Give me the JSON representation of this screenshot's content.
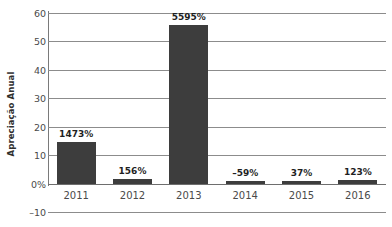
{
  "chart_data": {
    "type": "bar",
    "title": "",
    "xlabel": "",
    "ylabel": "Apreciação Anual",
    "categories": [
      "2011",
      "2012",
      "2013",
      "2014",
      "2015",
      "2016"
    ],
    "values": [
      14.73,
      1.56,
      55.95,
      -0.59,
      0.37,
      1.23
    ],
    "data_labels": [
      "1473%",
      "156%",
      "5595%",
      "–59%",
      "37%",
      "123%"
    ],
    "ylim": [
      -10,
      60
    ],
    "y_ticks": [
      60,
      50,
      40,
      30,
      20,
      10,
      0,
      -10
    ],
    "y_tick_labels": [
      "60",
      "50",
      "40",
      "30",
      "20",
      "10",
      "0%",
      "–10"
    ],
    "grid": true,
    "legend": "none",
    "bar_color": "#3d3d3d",
    "grid_color": "#8c8c8c",
    "axis_color": "#7a7a7a",
    "background": "#ffffff"
  }
}
